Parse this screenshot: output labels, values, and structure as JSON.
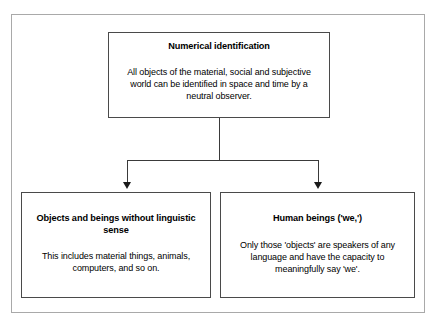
{
  "diagram": {
    "title": "Numerical identification",
    "root": {
      "title": "Numerical identification",
      "body": "All objects of the material, social and subjective world can be identified in space and time by a neutral observer."
    },
    "children": [
      {
        "title": "Objects and beings without linguistic sense",
        "body": "This includes material things, animals, computers, and so on."
      },
      {
        "title": "Human beings ('we,')",
        "body": "Only those 'objects' are speakers of any language and have the capacity to meaningfully say 'we'."
      }
    ],
    "colors": {
      "box_border": "#4a4a4a",
      "frame_border": "#a9a9a9",
      "connector": "#3a3a3a",
      "arrowhead": "#1a1a1a",
      "background": "#ffffff",
      "text": "#000000"
    }
  },
  "chart_data": {
    "type": "diagram",
    "subtype": "tree",
    "title": "Numerical identification",
    "nodes": [
      {
        "id": "root",
        "level": 0,
        "title": "Numerical identification",
        "body": "All objects of the material, social and subjective world can be identified in space and time by a neutral observer."
      },
      {
        "id": "child-1",
        "level": 1,
        "title": "Objects and beings without linguistic sense",
        "body": "This includes material things, animals, computers, and so on."
      },
      {
        "id": "child-2",
        "level": 1,
        "title": "Human beings ('we,')",
        "body": "Only those 'objects' are speakers of any language and have the capacity to meaningfully say 'we'."
      }
    ],
    "edges": [
      {
        "from": "root",
        "to": "child-1",
        "arrow": "down"
      },
      {
        "from": "root",
        "to": "child-2",
        "arrow": "down"
      }
    ]
  }
}
